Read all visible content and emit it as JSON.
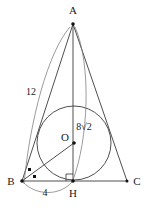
{
  "figure": {
    "type": "geometry-diagram",
    "background": "#ffffff",
    "line_color": "#3b3b3b",
    "arc_color": "#7a7a7a",
    "text_color": "#1a1a1a",
    "vertices": {
      "A": {
        "label": "A",
        "x": 73,
        "y": 24,
        "label_x": 73,
        "label_y": 14
      },
      "B": {
        "label": "B",
        "x": 22,
        "y": 181,
        "label_x": 11,
        "label_y": 184
      },
      "C": {
        "label": "C",
        "x": 127,
        "y": 181,
        "label_x": 137,
        "label_y": 184
      },
      "H": {
        "label": "H",
        "x": 73,
        "y": 181,
        "label_x": 73,
        "label_y": 196
      },
      "O": {
        "label": "O",
        "x": 74,
        "y": 143,
        "label_x": 65,
        "label_y": 140
      }
    },
    "circle": {
      "center_x": 74,
      "center_y": 143,
      "radius": 37
    },
    "measurements": [
      {
        "name": "side-AB-length",
        "text": "12",
        "x": 31,
        "y": 94
      },
      {
        "name": "segment-AH-or-AO-length",
        "text": "8√2",
        "x": 84,
        "y": 130
      },
      {
        "name": "segment-BH-length",
        "text": "4",
        "x": 45,
        "y": 195
      }
    ],
    "markers": {
      "right_angle_at_H": true,
      "angle_ticks_at_B": 2
    },
    "segments": [
      {
        "name": "segment-AB",
        "from": "A",
        "to": "B"
      },
      {
        "name": "segment-AC",
        "from": "A",
        "to": "C"
      },
      {
        "name": "segment-BC",
        "from": "B",
        "to": "C"
      },
      {
        "name": "segment-AH",
        "from": "A",
        "to": "H"
      },
      {
        "name": "segment-OB",
        "from": "O",
        "to": "B"
      }
    ],
    "arcs": [
      {
        "name": "arc-measure-12",
        "label": "12"
      },
      {
        "name": "arc-measure-8root2",
        "label": "8√2"
      },
      {
        "name": "arc-measure-4",
        "label": "4"
      }
    ]
  }
}
